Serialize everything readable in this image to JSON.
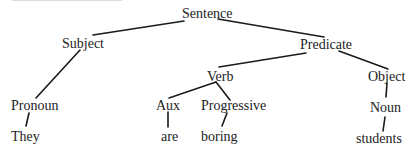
{
  "diagram": {
    "type": "syntax-tree",
    "nodes": {
      "sentence": "Sentence",
      "subject": "Subject",
      "predicate": "Predicate",
      "pronoun": "Pronoun",
      "verb": "Verb",
      "object": "Object",
      "aux": "Aux",
      "progressive": "Progressive",
      "noun": "Noun",
      "they": "They",
      "are": "are",
      "boring": "boring",
      "students": "students"
    },
    "edges": [
      [
        "Sentence",
        "Subject"
      ],
      [
        "Sentence",
        "Predicate"
      ],
      [
        "Subject",
        "Pronoun"
      ],
      [
        "Pronoun",
        "They"
      ],
      [
        "Predicate",
        "Verb"
      ],
      [
        "Predicate",
        "Object"
      ],
      [
        "Verb",
        "Aux"
      ],
      [
        "Verb",
        "Progressive"
      ],
      [
        "Aux",
        "are"
      ],
      [
        "Progressive",
        "boring"
      ],
      [
        "Object",
        "Noun"
      ],
      [
        "Noun",
        "students"
      ]
    ],
    "line_color": "#1a1a1a",
    "text_color": "#222222"
  }
}
